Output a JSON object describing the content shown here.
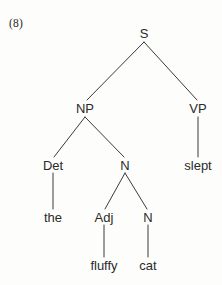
{
  "figure": {
    "example_number": "(8)",
    "width": 222,
    "height": 285,
    "background_color": "#fdfdfb",
    "text_color": "#2a2a2a",
    "line_color": "#3a3a3a"
  },
  "tree": {
    "nodes": [
      {
        "id": "s",
        "label": "S",
        "x": 144,
        "y": 33,
        "kind": "nonterminal"
      },
      {
        "id": "np",
        "label": "NP",
        "x": 85,
        "y": 108,
        "kind": "nonterminal"
      },
      {
        "id": "vp",
        "label": "VP",
        "x": 198,
        "y": 108,
        "kind": "nonterminal"
      },
      {
        "id": "det",
        "label": "Det",
        "x": 53,
        "y": 165,
        "kind": "nonterminal"
      },
      {
        "id": "n1",
        "label": "N",
        "x": 125,
        "y": 165,
        "kind": "nonterminal"
      },
      {
        "id": "slept",
        "label": "slept",
        "x": 198,
        "y": 165,
        "kind": "terminal"
      },
      {
        "id": "the",
        "label": "the",
        "x": 53,
        "y": 217,
        "kind": "terminal"
      },
      {
        "id": "adj",
        "label": "Adj",
        "x": 104,
        "y": 217,
        "kind": "nonterminal"
      },
      {
        "id": "n2",
        "label": "N",
        "x": 148,
        "y": 217,
        "kind": "nonterminal"
      },
      {
        "id": "fluffy",
        "label": "fluffy",
        "x": 104,
        "y": 265,
        "kind": "terminal"
      },
      {
        "id": "cat",
        "label": "cat",
        "x": 148,
        "y": 265,
        "kind": "terminal"
      }
    ],
    "edges": [
      {
        "from": "s",
        "to": "np",
        "x1": 144,
        "y1": 42,
        "x2": 87,
        "y2": 100
      },
      {
        "from": "s",
        "to": "vp",
        "x1": 144,
        "y1": 42,
        "x2": 197,
        "y2": 100
      },
      {
        "from": "np",
        "to": "det",
        "x1": 85,
        "y1": 117,
        "x2": 54,
        "y2": 157
      },
      {
        "from": "np",
        "to": "n1",
        "x1": 85,
        "y1": 117,
        "x2": 124,
        "y2": 157
      },
      {
        "from": "vp",
        "to": "slept",
        "x1": 198,
        "y1": 117,
        "x2": 198,
        "y2": 157
      },
      {
        "from": "det",
        "to": "the",
        "x1": 53,
        "y1": 173,
        "x2": 53,
        "y2": 209
      },
      {
        "from": "n1",
        "to": "adj",
        "x1": 125,
        "y1": 173,
        "x2": 105,
        "y2": 209
      },
      {
        "from": "n1",
        "to": "n2",
        "x1": 125,
        "y1": 173,
        "x2": 147,
        "y2": 209
      },
      {
        "from": "adj",
        "to": "fluffy",
        "x1": 104,
        "y1": 225,
        "x2": 104,
        "y2": 257
      },
      {
        "from": "n2",
        "to": "cat",
        "x1": 148,
        "y1": 225,
        "x2": 148,
        "y2": 257
      }
    ],
    "sentence": "the fluffy cat slept"
  }
}
